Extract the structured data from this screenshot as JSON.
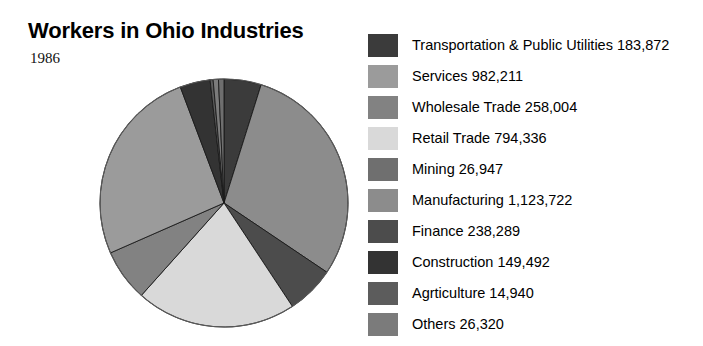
{
  "header": {
    "title": "Workers in Ohio Industries",
    "subtitle": "1986"
  },
  "chart_data": {
    "type": "pie",
    "title": "Workers in Ohio Industries",
    "subtitle": "1986",
    "xlabel": "",
    "ylabel": "",
    "grid": false,
    "legend_position": "right",
    "value_unit": "workers",
    "total": 3598133,
    "categories": [
      "Transportation & Public Utilities",
      "Services",
      "Wholesale Trade",
      "Retail Trade",
      "Mining",
      "Manufacturing",
      "Finance",
      "Construction",
      "Agrticulture",
      "Others"
    ],
    "values": [
      183872,
      982211,
      258004,
      794336,
      26947,
      1123722,
      238289,
      149492,
      14940,
      26320
    ],
    "value_labels": [
      "183,872",
      "982,211",
      "258,004",
      "794,336",
      "26,947",
      "1,123,722",
      "238,289",
      "149,492",
      "14,940",
      "26,320"
    ],
    "colors": [
      "#3b3b3b",
      "#9b9b9b",
      "#828282",
      "#d9d9d9",
      "#6f6f6f",
      "#8c8c8c",
      "#4c4c4c",
      "#333333",
      "#5c5c5c",
      "#7b7b7b"
    ],
    "slice_order": [
      "Transportation & Public Utilities",
      "Manufacturing",
      "Finance",
      "Retail Trade",
      "Wholesale Trade",
      "Services",
      "Construction",
      "Agrticulture",
      "Others",
      "Mining"
    ],
    "start_angle_deg": 0,
    "direction": "clockwise"
  },
  "legend": {
    "items": [
      {
        "label": "Transportation & Public Utilities 183,872",
        "name": "transportation-and-public-utilities",
        "color": "#3b3b3b"
      },
      {
        "label": "Services 982,211",
        "name": "services",
        "color": "#9b9b9b"
      },
      {
        "label": "Wholesale Trade 258,004",
        "name": "wholesale-trade",
        "color": "#828282"
      },
      {
        "label": "Retail Trade 794,336",
        "name": "retail-trade",
        "color": "#d9d9d9"
      },
      {
        "label": "Mining 26,947",
        "name": "mining",
        "color": "#6f6f6f"
      },
      {
        "label": "Manufacturing 1,123,722",
        "name": "manufacturing",
        "color": "#8c8c8c"
      },
      {
        "label": "Finance 238,289",
        "name": "finance",
        "color": "#4c4c4c"
      },
      {
        "label": "Construction 149,492",
        "name": "construction",
        "color": "#333333"
      },
      {
        "label": "Agrticulture 14,940",
        "name": "agrticulture",
        "color": "#5c5c5c"
      },
      {
        "label": "Others 26,320",
        "name": "others",
        "color": "#7b7b7b"
      }
    ]
  }
}
